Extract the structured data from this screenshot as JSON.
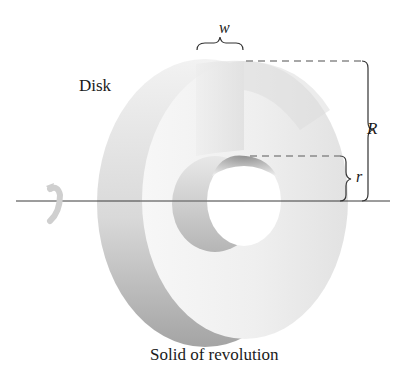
{
  "figure": {
    "labels": {
      "disk": "Disk",
      "caption": "Solid of revolution",
      "width_symbol": "w",
      "outer_radius_symbol": "R",
      "inner_radius_symbol": "r"
    },
    "colors": {
      "background": "#ffffff",
      "disk_face_light": "#f4f4f4",
      "disk_face_mid": "#e6e6e6",
      "disk_side_shadow": "#a9a9a9",
      "inner_wall_shadow": "#9c9c9c",
      "axis_line": "#333333",
      "dash_line": "#8a8a8a",
      "brace": "#444444",
      "text": "#1a1a1a"
    },
    "geometry": {
      "axis_y": 201,
      "outer_top_y": 61,
      "inner_top_y": 156,
      "width_brace": {
        "x1": 196,
        "x2": 244,
        "y": 50
      },
      "R_brace": {
        "x": 366,
        "y1": 61,
        "y2": 201
      },
      "r_brace": {
        "x": 346,
        "y1": 156,
        "y2": 201
      }
    }
  }
}
